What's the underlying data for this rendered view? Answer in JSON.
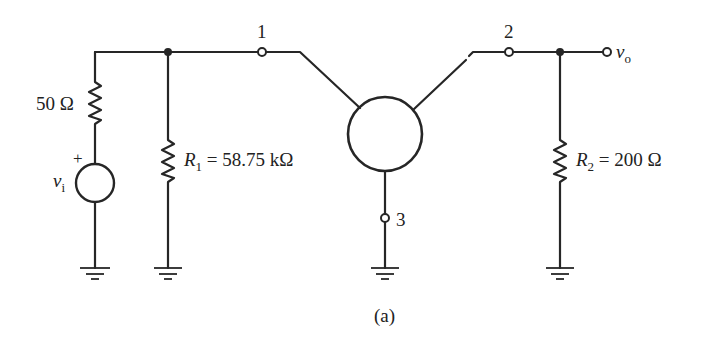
{
  "diagram": {
    "type": "circuit-schematic",
    "caption": "(a)",
    "colors": {
      "ink": "#262626",
      "background": "#ffffff"
    },
    "source": {
      "symbol": "v",
      "subscript": "i",
      "polarity": "+",
      "series_resistor": "50 Ω"
    },
    "resistors": {
      "r1": {
        "name": "R",
        "subscript": "1",
        "value": "= 58.75 kΩ"
      },
      "r2": {
        "name": "R",
        "subscript": "2",
        "value": "= 200 Ω"
      }
    },
    "terminals": {
      "t1": "1",
      "t2": "2",
      "t3": "3"
    },
    "output": {
      "symbol": "v",
      "subscript": "o"
    },
    "grounds": 4
  }
}
